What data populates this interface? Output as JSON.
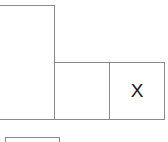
{
  "board": {
    "cells": [
      {
        "id": "tall-left",
        "mark": ""
      },
      {
        "id": "middle",
        "mark": ""
      },
      {
        "id": "right",
        "mark": "X"
      },
      {
        "id": "bottom-left",
        "mark": ""
      }
    ]
  },
  "colors": {
    "border": "#8a8a8a",
    "mark": "#1a1a1a",
    "background": "#ffffff"
  }
}
